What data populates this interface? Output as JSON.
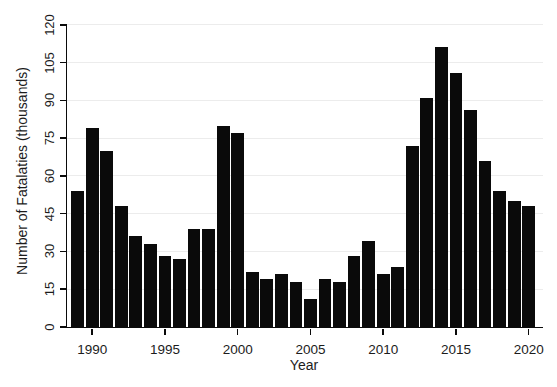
{
  "chart_data": {
    "type": "bar",
    "xlabel": "Year",
    "ylabel": "Number of Fatalaties (thousands)",
    "categories": [
      1989,
      1990,
      1991,
      1992,
      1993,
      1994,
      1995,
      1996,
      1997,
      1998,
      1999,
      2000,
      2001,
      2002,
      2003,
      2004,
      2005,
      2006,
      2007,
      2008,
      2009,
      2010,
      2011,
      2012,
      2013,
      2014,
      2015,
      2016,
      2017,
      2018,
      2019,
      2020
    ],
    "values": [
      54,
      79,
      70,
      48,
      36,
      33,
      28,
      27,
      39,
      39,
      80,
      77,
      22,
      19,
      21,
      18,
      11,
      19,
      18,
      28,
      34,
      21,
      24,
      72,
      91,
      111,
      101,
      86,
      66,
      54,
      50,
      48
    ],
    "yticks": [
      0,
      15,
      30,
      45,
      60,
      75,
      90,
      105,
      120
    ],
    "xticks": [
      1990,
      1995,
      2000,
      2005,
      2010,
      2015,
      2020
    ],
    "ylim": [
      0,
      120
    ],
    "grid": true,
    "legend": "none",
    "bar_color": "#0a0a0a",
    "grid_color": "#ececec",
    "axis_color": "#0a0a0a",
    "background": "#ffffff"
  }
}
